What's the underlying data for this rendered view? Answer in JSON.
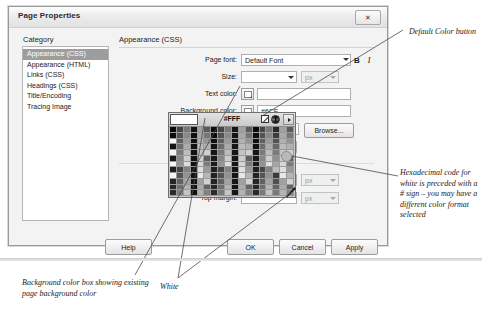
{
  "dialog": {
    "title": "Page Properties",
    "close_label": "✕",
    "category_header": "Category",
    "categories": [
      {
        "label": "Appearance (CSS)",
        "selected": true
      },
      {
        "label": "Appearance (HTML)",
        "selected": false
      },
      {
        "label": "Links (CSS)",
        "selected": false
      },
      {
        "label": "Headings (CSS)",
        "selected": false
      },
      {
        "label": "Title/Encoding",
        "selected": false
      },
      {
        "label": "Tracing Image",
        "selected": false
      }
    ],
    "pane_title": "Appearance (CSS)",
    "fields": {
      "page_font_label": "Page font:",
      "page_font_value": "Default Font",
      "bold_label": "B",
      "italic_label": "I",
      "size_label": "Size:",
      "size_value": "",
      "size_unit": "px",
      "text_color_label": "Text color:",
      "text_color_value": "",
      "background_color_label": "Background color:",
      "background_color_value": "#6CF",
      "background_image_label": "Background image:",
      "background_image_value": "",
      "browse_label": "Browse...",
      "repeat_label": "Repeat:",
      "repeat_value": "",
      "left_margin_label": "Left margin:",
      "left_margin_value": "",
      "left_margin_unit": "px",
      "top_margin_label": "Top margin:",
      "top_margin_value": "",
      "top_margin_unit": "px"
    },
    "buttons": {
      "help": "Help",
      "ok": "OK",
      "cancel": "Cancel",
      "apply": "Apply"
    }
  },
  "color_picker": {
    "hex_value": "#FFF",
    "preview_color": "#FFFFFF",
    "no_color_icon": "no-color-icon",
    "color_wheel_icon": "color-wheel-icon",
    "menu_icon": "menu-arrow-icon"
  },
  "annotations": {
    "default_color_button": "Default Color button",
    "hex_note": "Hexadecimal code for white is preceded with a # sign – you may have a different color format selected",
    "background_color_box": "Background color box showing existing page background color",
    "white": "White"
  },
  "colors": {
    "selection": "#9D9D9D",
    "dialog_bg": "#F3F3F3",
    "white": "#FFFFFF"
  }
}
